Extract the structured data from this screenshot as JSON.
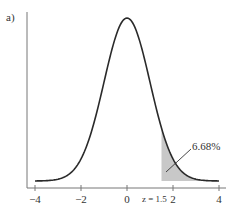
{
  "chart_data": {
    "type": "line",
    "title": "",
    "panel_label": "a)",
    "xlabel": "",
    "ylabel": "",
    "xlim": [
      -4.2,
      4.2
    ],
    "x_ticks": [
      -4,
      -2,
      0,
      2,
      4
    ],
    "x_tick_labels": [
      "−4",
      "−2",
      "0",
      "2",
      "4"
    ],
    "grid": false,
    "series": [
      {
        "name": "Standard normal density",
        "distribution": "normal",
        "mean": 0,
        "sd": 1
      }
    ],
    "shaded_region": {
      "from": 1.5,
      "to": 4,
      "fill": "#c8c8c8"
    },
    "annotations": [
      {
        "text": "6.68%",
        "target": "shaded tail area"
      },
      {
        "text": "z = 1.5",
        "x": 1.5
      }
    ]
  },
  "labels": {
    "panel": "a)",
    "percent": "6.68%",
    "z_marker": "z = 1.5",
    "ticks": [
      "−4",
      "−2",
      "0",
      "2",
      "4"
    ]
  }
}
